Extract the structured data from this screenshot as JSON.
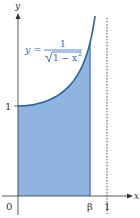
{
  "chart_data": {
    "type": "area",
    "title": "",
    "function": "y = 1/sqrt(1 - x^2)",
    "equation_label": {
      "lhs": "y =",
      "numerator": "1",
      "denominator": "√1 − x²"
    },
    "xlabel": "x",
    "ylabel": "y",
    "x_ticks": [
      {
        "value": 0,
        "label": "0"
      },
      {
        "value": 0.81,
        "label": "β"
      },
      {
        "value": 1,
        "label": "1"
      }
    ],
    "y_ticks": [
      {
        "value": 1,
        "label": "1"
      }
    ],
    "shaded_region": {
      "from_x": 0,
      "to_x": 0.81,
      "description": "area under curve from 0 to β"
    },
    "asymptote": {
      "x": 1,
      "style": "dashed"
    },
    "x": [
      0,
      0.1,
      0.2,
      0.3,
      0.4,
      0.5,
      0.6,
      0.7,
      0.8,
      0.866
    ],
    "values": [
      1.0,
      1.005,
      1.021,
      1.048,
      1.091,
      1.155,
      1.25,
      1.4,
      1.667,
      2.0
    ],
    "xlim": [
      0,
      1.15
    ],
    "ylim": [
      0,
      2.0
    ],
    "grid": false,
    "colors": {
      "curve": "#2a5ea8",
      "fill": "#8fb4df",
      "axes": "#333333",
      "asymptote": "#555555",
      "equation": "#2f6db3"
    }
  },
  "labels": {
    "y_axis": "y",
    "x_axis": "x",
    "origin": "0",
    "y_one": "1",
    "beta": "β",
    "x_one": "1",
    "eq_lhs": "y =",
    "eq_num": "1",
    "eq_den": "1 − x",
    "eq_exp": "2"
  }
}
